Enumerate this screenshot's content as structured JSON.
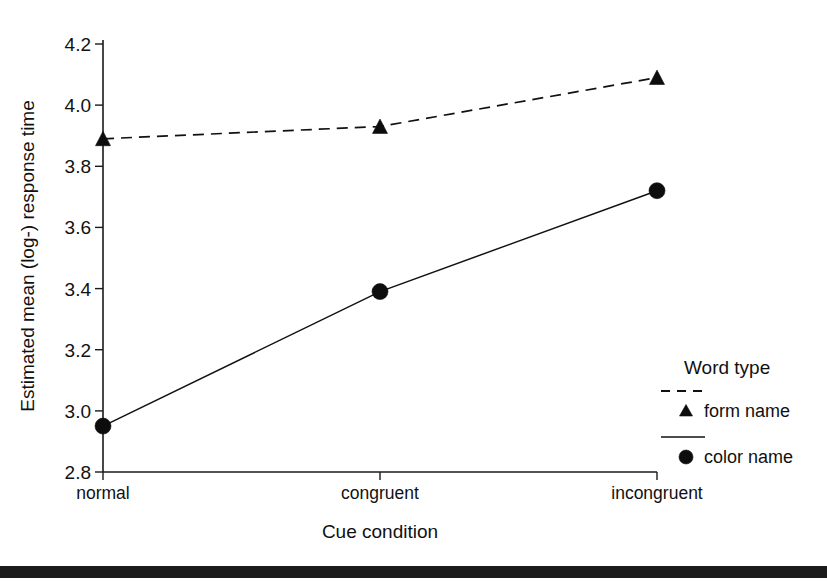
{
  "chart_data": {
    "type": "line",
    "title": "",
    "xlabel": "Cue condition",
    "ylabel": "Estimated mean (log-) response time",
    "categories": [
      "normal",
      "congruent",
      "incongruent"
    ],
    "ylim": [
      2.8,
      4.2
    ],
    "yticks": [
      "2.8",
      "3.0",
      "3.2",
      "3.4",
      "3.6",
      "3.8",
      "4.0",
      "4.2"
    ],
    "ytick_values": [
      2.8,
      3.0,
      3.2,
      3.4,
      3.6,
      3.8,
      4.0,
      4.2
    ],
    "grid": false,
    "legend_position": "right-inside-lower",
    "series": [
      {
        "name": "form name",
        "values": [
          3.89,
          3.93,
          4.09
        ],
        "marker": "triangle",
        "linestyle": "dashed",
        "color": "#0d0d0d"
      },
      {
        "name": "color name",
        "values": [
          2.95,
          3.39,
          3.72
        ],
        "marker": "circle",
        "linestyle": "solid",
        "color": "#0d0d0d"
      }
    ]
  },
  "legend": {
    "title": "Word type",
    "entries": [
      {
        "label": "form name",
        "marker": "triangle",
        "linestyle": "dashed"
      },
      {
        "label": "color name",
        "marker": "circle",
        "linestyle": "solid"
      }
    ]
  },
  "axes": {
    "y_title": "Estimated mean (log-) response time",
    "x_title": "Cue condition",
    "y_tick_labels": {
      "t0": "2.8",
      "t1": "3.0",
      "t2": "3.2",
      "t3": "3.4",
      "t4": "3.6",
      "t5": "3.8",
      "t6": "4.0",
      "t7": "4.2"
    },
    "x_tick_labels": {
      "t0": "normal",
      "t1": "congruent",
      "t2": "incongruent"
    }
  },
  "colors": {
    "ink": "#0d0d0d",
    "axis": "#1a1a1a",
    "background": "#ffffff",
    "footer_bar": "#1b1b1b"
  }
}
